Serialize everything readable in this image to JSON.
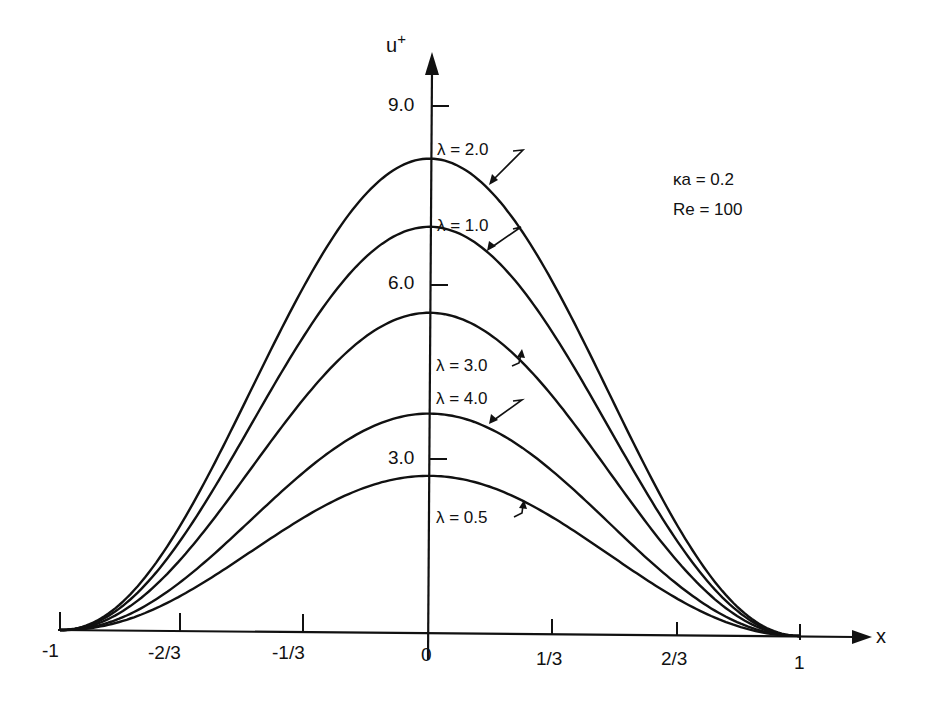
{
  "chart_data": {
    "type": "line",
    "title": "",
    "xlabel": "x",
    "ylabel": "u+",
    "xlim": [
      -1,
      1
    ],
    "ylim": [
      0,
      10
    ],
    "grid": false,
    "legend_position": "inline labels with arrows",
    "x_ticks": [
      "-1",
      "-2/3",
      "-1/3",
      "0",
      "1/3",
      "2/3",
      "1"
    ],
    "y_ticks": [
      "3.0",
      "6.0",
      "9.0"
    ],
    "annotations": [
      "κa = 0.2",
      "Re = 100"
    ],
    "x": [
      -1,
      -0.8,
      -0.6,
      -0.4,
      -0.2,
      0,
      0.2,
      0.4,
      0.6,
      0.8,
      1
    ],
    "series": [
      {
        "name": "λ = 2.0",
        "peak": 8.0,
        "values": [
          0,
          0.85,
          2.9,
          5.35,
          7.35,
          8.0,
          7.35,
          5.35,
          2.9,
          0.85,
          0
        ]
      },
      {
        "name": "λ = 1.0",
        "peak": 6.85,
        "values": [
          0,
          0.75,
          2.5,
          4.6,
          6.3,
          6.85,
          6.3,
          4.6,
          2.5,
          0.75,
          0
        ]
      },
      {
        "name": "λ = 3.0",
        "peak": 5.4,
        "values": [
          0,
          0.6,
          2.0,
          3.65,
          4.95,
          5.4,
          4.95,
          3.65,
          2.0,
          0.6,
          0
        ]
      },
      {
        "name": "λ = 4.0",
        "peak": 3.7,
        "values": [
          0,
          0.42,
          1.38,
          2.5,
          3.4,
          3.7,
          3.4,
          2.5,
          1.38,
          0.42,
          0
        ]
      },
      {
        "name": "λ = 0.5",
        "peak": 2.65,
        "values": [
          0,
          0.3,
          1.0,
          1.8,
          2.43,
          2.65,
          2.43,
          1.8,
          1.0,
          0.3,
          0
        ]
      }
    ]
  },
  "labels": {
    "y_axis_title": "u",
    "y_axis_sup": "+",
    "x_axis_title": "x",
    "y_ticks": {
      "t9": "9.0",
      "t6": "6.0",
      "t3": "3.0"
    },
    "x_ticks": {
      "m1": "-1",
      "m23": "-2/3",
      "m13": "-1/3",
      "z": "0",
      "p13": "1/3",
      "p23": "2/3",
      "p1": "1"
    },
    "curves": {
      "l20": "λ = 2.0",
      "l10": "λ = 1.0",
      "l30": "λ = 3.0",
      "l40": "λ = 4.0",
      "l05": "λ = 0.5"
    },
    "params": {
      "ka": "κa = 0.2",
      "re": "Re = 100"
    }
  }
}
